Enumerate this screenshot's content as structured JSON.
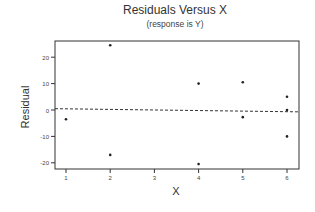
{
  "chart_data": {
    "type": "scatter",
    "title": "Residuals Versus X",
    "subtitle": "(response is Y)",
    "xlabel": "X",
    "ylabel": "Residual",
    "x_ticks": [
      1,
      2,
      3,
      4,
      5,
      6
    ],
    "y_ticks": [
      20,
      10,
      0,
      -10,
      -20
    ],
    "xlim": [
      0.75,
      6.3
    ],
    "ylim": [
      -22.5,
      26
    ],
    "grid": false,
    "legend": null,
    "reference_line": {
      "style": "dashed",
      "y_start": 0.5,
      "y_end": -0.7,
      "label": ""
    },
    "points": [
      {
        "x": 1,
        "y": -3.5
      },
      {
        "x": 2,
        "y": 24.5
      },
      {
        "x": 2,
        "y": -17
      },
      {
        "x": 4,
        "y": 10
      },
      {
        "x": 4,
        "y": -20.5
      },
      {
        "x": 5,
        "y": 10.5
      },
      {
        "x": 5,
        "y": -2.7
      },
      {
        "x": 6,
        "y": 5
      },
      {
        "x": 6,
        "y": 0
      },
      {
        "x": 6,
        "y": -10
      }
    ]
  },
  "labels": {
    "title": "Residuals Versus X",
    "subtitle": "(response is Y)",
    "xlabel": "X",
    "ylabel": "Residual"
  },
  "colors": {
    "axis": "#333333",
    "points": "#222222",
    "reference_line": "#333333"
  }
}
